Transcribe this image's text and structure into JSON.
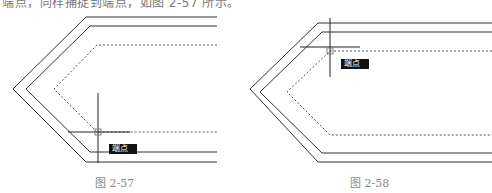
{
  "document": {
    "top_text": "端点，同样捕捉到端点，如图 2-57 所示。"
  },
  "figures": [
    {
      "caption": "图 2-57",
      "snap_tooltip": "端点",
      "description": "CAD drawing: two solid offset chevron polylines and one dashed inner polyline; crosshair cursor snapping to the lower endpoint of the dashed line"
    },
    {
      "caption": "图 2-58",
      "snap_tooltip": "端点",
      "description": "CAD drawing: same chevron polylines; crosshair cursor snapping to the upper endpoint of the dashed line"
    }
  ],
  "colors": {
    "line": "#333333",
    "dashed": "#555555",
    "caption": "#8a8a8a",
    "tooltip_bg": "#111111",
    "tooltip_text": "#ffffff"
  }
}
